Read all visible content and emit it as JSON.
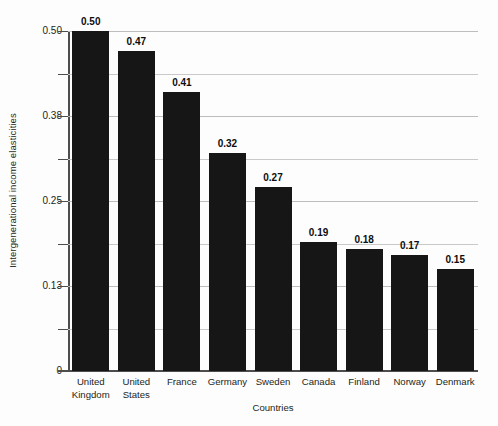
{
  "chart_data": {
    "type": "bar",
    "title": "",
    "xlabel": "Countries",
    "ylabel": "Intergenerational income elasticities",
    "categories": [
      "United Kingdom",
      "United States",
      "France",
      "Germany",
      "Sweden",
      "Canada",
      "Finland",
      "Norway",
      "Denmark"
    ],
    "category_lines": [
      [
        "United",
        "Kingdom"
      ],
      [
        "United",
        "States"
      ],
      [
        "France",
        ""
      ],
      [
        "Germany",
        ""
      ],
      [
        "Sweden",
        ""
      ],
      [
        "Canada",
        ""
      ],
      [
        "Finland",
        ""
      ],
      [
        "Norway",
        ""
      ],
      [
        "Denmark",
        ""
      ]
    ],
    "values": [
      0.5,
      0.47,
      0.41,
      0.32,
      0.27,
      0.19,
      0.18,
      0.17,
      0.15
    ],
    "value_labels": [
      "0.50",
      "0.47",
      "0.41",
      "0.32",
      "0.27",
      "0.19",
      "0.18",
      "0.17",
      "0.15"
    ],
    "ylim": [
      0,
      0.5
    ],
    "ytick_values": [
      0.5,
      0.4375,
      0.375,
      0.3125,
      0.25,
      0.1875,
      0.125,
      0.0625,
      0
    ],
    "ytick_labels": [
      "0.50",
      "",
      "0.38",
      "",
      "0.25",
      "",
      "0.13",
      "",
      "0"
    ],
    "grid": true,
    "grid_axis": "y",
    "legend": null,
    "bar_color": "#161616",
    "grid_color": "#c9c9c9",
    "axis_color": "#4d4d4d",
    "background_color": "#fdfdfd"
  }
}
